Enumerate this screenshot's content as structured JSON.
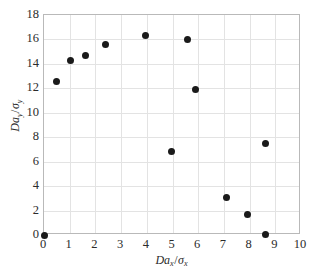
{
  "chart_data": {
    "type": "scatter",
    "title": "",
    "xlabel": "Da_x/σ_x",
    "ylabel": "Da_y/σ_y",
    "xlabel_parts": {
      "prefix": "Da",
      "prefix_sub": "x",
      "slash": "/",
      "sigma": "σ",
      "sigma_sub": "x"
    },
    "ylabel_parts": {
      "prefix": "Da",
      "prefix_sub": "y",
      "slash": "/",
      "sigma": "σ",
      "sigma_sub": "y"
    },
    "xlim": [
      0,
      10
    ],
    "ylim": [
      0,
      18
    ],
    "xticks": [
      0,
      1,
      2,
      3,
      4,
      5,
      6,
      7,
      8,
      9,
      10
    ],
    "yticks": [
      0,
      2,
      4,
      6,
      8,
      10,
      12,
      14,
      16,
      18
    ],
    "xtick_labels": [
      "0",
      "1",
      "2",
      "3",
      "4",
      "5",
      "6",
      "7",
      "8",
      "9",
      "10"
    ],
    "ytick_labels": [
      "0",
      "2",
      "4",
      "6",
      "8",
      "10",
      "12",
      "14",
      "16",
      "18"
    ],
    "grid": true,
    "grid_color": "#e3e3e3",
    "frame_color": "#b9b9b9",
    "marker_color": "#1a1a1a",
    "marker": "circle",
    "legend": null,
    "series": [
      {
        "name": "data",
        "points": [
          {
            "x": 0.0,
            "y": 0.0
          },
          {
            "x": 0.5,
            "y": 12.55
          },
          {
            "x": 1.05,
            "y": 14.25
          },
          {
            "x": 1.62,
            "y": 14.7
          },
          {
            "x": 2.38,
            "y": 15.6
          },
          {
            "x": 3.95,
            "y": 16.35
          },
          {
            "x": 4.95,
            "y": 6.85
          },
          {
            "x": 5.6,
            "y": 16.0
          },
          {
            "x": 5.9,
            "y": 11.9
          },
          {
            "x": 7.1,
            "y": 3.05
          },
          {
            "x": 7.9,
            "y": 1.7
          },
          {
            "x": 8.6,
            "y": 7.45
          },
          {
            "x": 8.6,
            "y": 0.05
          }
        ]
      }
    ]
  }
}
